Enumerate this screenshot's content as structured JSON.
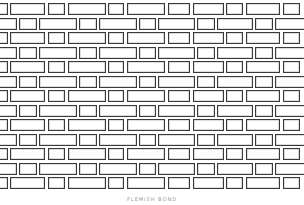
{
  "diagram": {
    "type": "brick-wall-pattern",
    "caption": "FLEMISH BOND",
    "colors": {
      "mortar_line": "#3a3a3a",
      "brick_fill": "#ffffff",
      "background": "#ffffff"
    },
    "row_height": 12,
    "row_pitch": 14.5,
    "first_row_top": 3,
    "row_pattern_sequence": [
      "A",
      "B",
      "A",
      "B",
      "A",
      "B",
      "A",
      "B",
      "A",
      "B",
      "A",
      "B",
      "A"
    ],
    "courses": {
      "A": [
        [
          -4,
          8
        ],
        [
          10,
          45
        ],
        [
          48,
          65
        ],
        [
          68,
          106
        ],
        [
          108,
          124
        ],
        [
          127,
          165
        ],
        [
          168,
          190
        ],
        [
          193,
          224
        ],
        [
          226,
          243
        ],
        [
          246,
          280
        ],
        [
          283,
          300
        ]
      ],
      "B": [
        [
          -4,
          17
        ],
        [
          19,
          37
        ],
        [
          39,
          77
        ],
        [
          79,
          97
        ],
        [
          99,
          137
        ],
        [
          139,
          156
        ],
        [
          158,
          195
        ],
        [
          197,
          215
        ],
        [
          217,
          253
        ],
        [
          255,
          273
        ],
        [
          275,
          308
        ]
      ]
    }
  }
}
